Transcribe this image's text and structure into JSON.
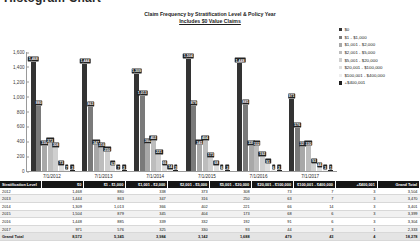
{
  "page": {
    "title": "Histogram Chart"
  },
  "chart_data": {
    "type": "bar",
    "title": "Claim Frequency by Stratification Level & Policy Year",
    "subtitle": "Includes $0 Value Claims",
    "xlabel": "",
    "ylabel": "",
    "ylim": [
      0,
      1600
    ],
    "yticks": [
      "0",
      "200",
      "400",
      "600",
      "800",
      "1,000",
      "1,200",
      "1,400",
      "1,600"
    ],
    "grid": false,
    "legend_position": "right",
    "categories": [
      "7/1/2012",
      "7/1/2013",
      "7/1/2014",
      "7/1/2015",
      "7/1/2016",
      "7/1/2017"
    ],
    "series": [
      {
        "name": "$0",
        "color": "#333333",
        "values": [
          1468,
          1444,
          1309,
          1504,
          1448,
          971
        ]
      },
      {
        "name": "$1 - $1,000",
        "color": "#7a7a7a",
        "values": [
          880,
          863,
          1013,
          879,
          885,
          576
        ]
      },
      {
        "name": "$1,001 - $2,000",
        "color": "#a8a8a8",
        "values": [
          338,
          347,
          366,
          345,
          339,
          325
        ]
      },
      {
        "name": "$2,001 - $5,000",
        "color": "#bdbdbd",
        "values": [
          373,
          316,
          402,
          404,
          332,
          330
        ]
      },
      {
        "name": "$5,001 - $20,000",
        "color": "#cfcfcf",
        "values": [
          308,
          250,
          221,
          173,
          192,
          93
        ]
      },
      {
        "name": "$20,001 - $100,000",
        "color": "#dedede",
        "values": [
          73,
          63,
          66,
          68,
          91,
          44
        ]
      },
      {
        "name": "$100,001 - $400,000",
        "color": "#eeeeee",
        "values": [
          7,
          7,
          14,
          6,
          6,
          3
        ]
      },
      {
        "name": "+$400,001",
        "color": "#1f1f1f",
        "values": [
          3,
          3,
          3,
          3,
          3,
          1
        ]
      }
    ]
  },
  "table": {
    "headers": [
      "Stratification Level",
      "$0",
      "$1 - $1,000",
      "$1,001 - $2,000",
      "$2,001 - $5,000",
      "$5,001 - $20,000",
      "$20,001 - $100,000",
      "$100,001 - $400,000",
      "+$400,001",
      "Grand Total"
    ],
    "rows": [
      [
        "2012",
        "1,468",
        "880",
        "338",
        "373",
        "308",
        "73",
        "7",
        "3",
        "3,504"
      ],
      [
        "2013",
        "1,444",
        "863",
        "347",
        "316",
        "250",
        "63",
        "7",
        "3",
        "3,470"
      ],
      [
        "2014",
        "1,309",
        "1,013",
        "366",
        "402",
        "221",
        "66",
        "14",
        "3",
        "3,401"
      ],
      [
        "2015",
        "1,504",
        "879",
        "345",
        "404",
        "173",
        "68",
        "6",
        "3",
        "3,399"
      ],
      [
        "2016",
        "1,448",
        "885",
        "339",
        "332",
        "192",
        "91",
        "6",
        "3",
        "3,304"
      ],
      [
        "2017",
        "971",
        "576",
        "325",
        "330",
        "93",
        "44",
        "3",
        "1",
        "2,333"
      ]
    ],
    "total_row": [
      "Grand Total",
      "8,572",
      "5,345",
      "3,984",
      "3,142",
      "1,688",
      "479",
      "43",
      "4",
      "18,278"
    ]
  }
}
